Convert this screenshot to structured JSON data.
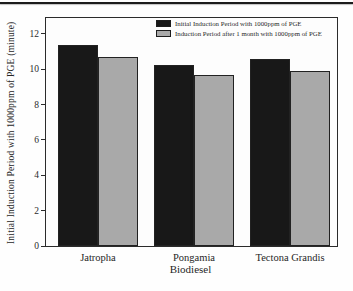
{
  "chart_data": {
    "type": "bar",
    "title": "",
    "xlabel": "Biodiesel",
    "ylabel": "Initial Induction Period with 1000ppm of PGE (minute)",
    "categories": [
      "Jatropha",
      "Pongamia",
      "Tectona Grandis"
    ],
    "series": [
      {
        "name": "Initial Induction Period with 1000ppm of PGE",
        "color": "#181818",
        "values": [
          11.35,
          10.25,
          10.6
        ]
      },
      {
        "name": "Induction Period after 1 month with 1000ppm of PGE",
        "color": "#a9a9a9",
        "values": [
          10.7,
          9.65,
          9.9
        ]
      }
    ],
    "ylim": [
      0,
      12.9
    ],
    "yticks": [
      0,
      2,
      4,
      6,
      8,
      10,
      12
    ],
    "legend_position": "top-right",
    "grid": false,
    "frame_color": "#2b2b2b",
    "rule_color": "#1c1c1c"
  }
}
